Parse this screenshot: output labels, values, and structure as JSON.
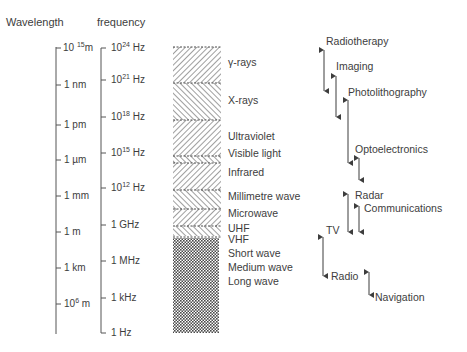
{
  "headers": {
    "wavelength": "Wavelength",
    "frequency": "frequency"
  },
  "wavelength_ticks": [
    {
      "base": "10",
      "exp": "15",
      "unit": "m",
      "y": 48,
      "note": "10^-15 m"
    },
    {
      "base": "1 nm",
      "exp": "",
      "unit": "",
      "y": 85
    },
    {
      "base": "1 pm",
      "exp": "",
      "unit": "",
      "y": 125
    },
    {
      "base": "1 µm",
      "exp": "",
      "unit": "",
      "y": 160
    },
    {
      "base": "1 mm",
      "exp": "",
      "unit": "",
      "y": 196
    },
    {
      "base": "1 m",
      "exp": "",
      "unit": "",
      "y": 232
    },
    {
      "base": "1 km",
      "exp": "",
      "unit": "",
      "y": 268
    },
    {
      "base": "10",
      "exp": "6",
      "unit": " m",
      "y": 304
    }
  ],
  "frequency_ticks": [
    {
      "base": "10",
      "exp": "24",
      "unit": " Hz",
      "y": 48
    },
    {
      "base": "10",
      "exp": "21",
      "unit": " Hz",
      "y": 80
    },
    {
      "base": "10",
      "exp": "18",
      "unit": " Hz",
      "y": 117
    },
    {
      "base": "10",
      "exp": "15",
      "unit": " Hz",
      "y": 153
    },
    {
      "base": "10",
      "exp": "12",
      "unit": " Hz",
      "y": 188
    },
    {
      "base": "1 GHz",
      "exp": "",
      "unit": "",
      "y": 225
    },
    {
      "base": "1 MHz",
      "exp": "",
      "unit": "",
      "y": 261
    },
    {
      "base": "1 kHz",
      "exp": "",
      "unit": "",
      "y": 298
    },
    {
      "base": "1 Hz",
      "exp": "",
      "unit": "",
      "y": 333
    }
  ],
  "bands": [
    {
      "label": "γ-rays",
      "label_y": 62
    },
    {
      "label": "X-rays",
      "label_y": 100
    },
    {
      "label": "Ultraviolet",
      "label_y": 136
    },
    {
      "label": "Visible light",
      "label_y": 153
    },
    {
      "label": "Infrared",
      "label_y": 172
    },
    {
      "label": "Millimetre wave",
      "label_y": 196
    },
    {
      "label": "Microwave",
      "label_y": 213
    },
    {
      "label": "UHF",
      "label_y": 228
    },
    {
      "label": "VHF",
      "label_y": 239
    },
    {
      "label": "Short wave",
      "label_y": 253
    },
    {
      "label": "Medium wave",
      "label_y": 267
    },
    {
      "label": "Long wave",
      "label_y": 281
    }
  ],
  "applications": [
    {
      "label": "Radiotherapy",
      "x": 326,
      "y": 35
    },
    {
      "label": "Imaging",
      "x": 336,
      "y": 60
    },
    {
      "label": "Photolithography",
      "x": 348,
      "y": 86
    },
    {
      "label": "Optoelectronics",
      "x": 355,
      "y": 143
    },
    {
      "label": "Radar",
      "x": 355,
      "y": 189
    },
    {
      "label": "Communications",
      "x": 364,
      "y": 202
    },
    {
      "label": "TV",
      "x": 326,
      "y": 224
    },
    {
      "label": "Radio",
      "x": 331,
      "y": 270
    },
    {
      "label": "Navigation",
      "x": 375,
      "y": 291
    }
  ],
  "colors": {
    "ink": "#3d3d3d",
    "hatch": "#5a5a5a",
    "background": "#ffffff"
  }
}
